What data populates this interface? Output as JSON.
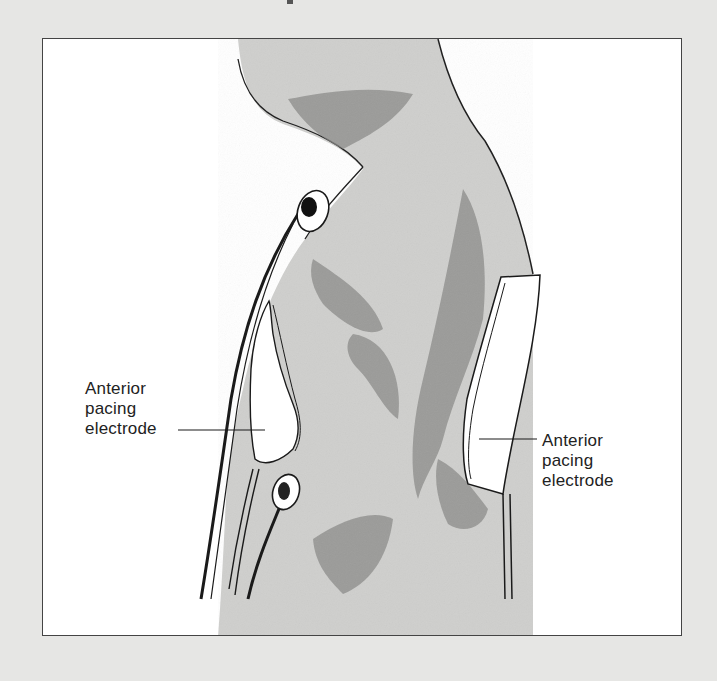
{
  "figure": {
    "labels": [
      {
        "id": "left",
        "lines": [
          "Anterior",
          "pacing",
          "electrode"
        ]
      },
      {
        "id": "right",
        "lines": [
          "Anterior",
          "pacing",
          "electrode"
        ]
      }
    ],
    "colors": {
      "page_background": "#e6e6e4",
      "frame_background": "#ffffff",
      "frame_border": "#444444",
      "body_fill": "#cfcfcd",
      "shading": "#7a7a78",
      "line": "#1a1a1a",
      "pad_fill": "#ffffff"
    }
  }
}
